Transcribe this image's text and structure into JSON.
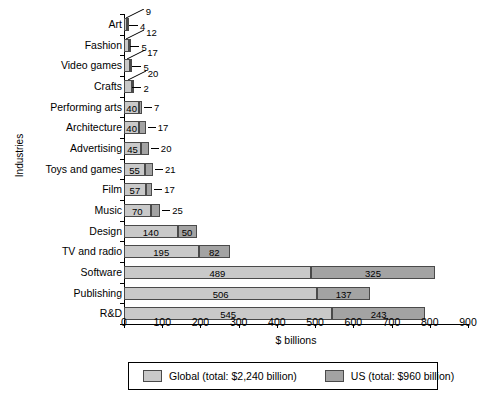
{
  "chart_data": {
    "type": "bar",
    "orientation": "horizontal",
    "stacked": true,
    "title": "",
    "xlabel": "$ billions",
    "ylabel": "Industries",
    "xlim": [
      0,
      900
    ],
    "xticks": [
      0,
      100,
      200,
      300,
      400,
      500,
      600,
      700,
      800,
      900
    ],
    "grid": false,
    "legend_position": "bottom",
    "categories": [
      "Art",
      "Fashion",
      "Video games",
      "Crafts",
      "Performing arts",
      "Architecture",
      "Advertising",
      "Toys and games",
      "Film",
      "Music",
      "Design",
      "TV and radio",
      "Software",
      "Publishing",
      "R&D"
    ],
    "series": [
      {
        "name": "Global",
        "legend_label": "Global (total: $2,240 billion)",
        "color": "#c9c9c9",
        "values": [
          9,
          12,
          17,
          20,
          40,
          40,
          45,
          55,
          57,
          70,
          140,
          195,
          489,
          506,
          545
        ]
      },
      {
        "name": "US",
        "legend_label": "US (total: $960 billion)",
        "color": "#a3a3a3",
        "values": [
          4,
          5,
          5,
          2,
          7,
          17,
          20,
          21,
          17,
          25,
          50,
          82,
          325,
          137,
          243
        ]
      }
    ],
    "totals": {
      "global": 2240,
      "us": 960
    }
  }
}
